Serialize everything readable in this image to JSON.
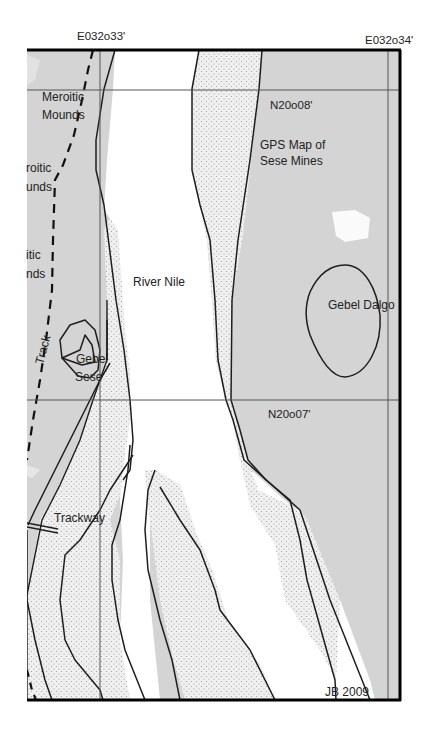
{
  "map": {
    "title_line1": "GPS Map of",
    "title_line2": "Sese Mines",
    "credit": "JB 2009",
    "colors": {
      "desert": "#d4d4d4",
      "river": "#ffffff",
      "sand": "#eeeeee",
      "outline": "#1e1e1e",
      "grid": "#555555",
      "frame": "#000000"
    },
    "coordinates": {
      "lon_west": "E032o33'",
      "lon_east": "E032o34'",
      "lat_north": "N20o08'",
      "lat_south": "N20o07'"
    },
    "features": {
      "river": "River Nile",
      "gebel_dalgo": "Gebel Dalgo",
      "gebel_sese_line1": "Gebel",
      "gebel_sese_line2": "Sese",
      "meroitic_1_line1": "Meroitic",
      "meroitic_1_line2": "Mounds",
      "meroitic_2_line1": "roitic",
      "meroitic_2_line2": "unds",
      "meroitic_3_line1": "itic",
      "meroitic_3_line2": "nds",
      "track": "Track",
      "trackway": "Trackway"
    }
  }
}
